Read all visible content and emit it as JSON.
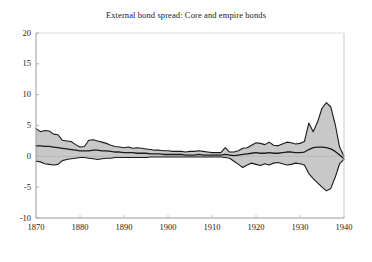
{
  "chart_data": {
    "type": "area",
    "title": "External bond spread: Core and empire bonds",
    "xlabel": "",
    "ylabel": "",
    "xlim": [
      1870,
      1940
    ],
    "ylim": [
      -10,
      20
    ],
    "grid": false,
    "legend": null,
    "xticks": [
      1870,
      1880,
      1890,
      1900,
      1910,
      1920,
      1930,
      1940
    ],
    "yticks": [
      20,
      15,
      10,
      5,
      0,
      -5,
      -10
    ],
    "fill_color": "#c8c8c8",
    "line_color": "#1a1a1a",
    "x": [
      1870,
      1871,
      1872,
      1873,
      1874,
      1875,
      1876,
      1877,
      1878,
      1879,
      1880,
      1881,
      1882,
      1883,
      1884,
      1885,
      1886,
      1887,
      1888,
      1889,
      1890,
      1891,
      1892,
      1893,
      1894,
      1895,
      1896,
      1897,
      1898,
      1899,
      1900,
      1901,
      1902,
      1903,
      1904,
      1905,
      1906,
      1907,
      1908,
      1909,
      1910,
      1911,
      1912,
      1913,
      1914,
      1915,
      1916,
      1917,
      1918,
      1919,
      1920,
      1921,
      1922,
      1923,
      1924,
      1925,
      1926,
      1927,
      1928,
      1929,
      1930,
      1931,
      1932,
      1933,
      1934,
      1935,
      1936,
      1937,
      1938,
      1939,
      1940
    ],
    "series": [
      {
        "name": "upper",
        "values": [
          4.5,
          4.0,
          4.2,
          4.1,
          3.6,
          3.5,
          2.6,
          2.5,
          2.4,
          1.9,
          1.5,
          1.6,
          2.6,
          2.7,
          2.5,
          2.3,
          2.1,
          1.8,
          1.6,
          1.5,
          1.4,
          1.5,
          1.3,
          1.4,
          1.3,
          1.2,
          1.1,
          1.0,
          1.0,
          0.9,
          0.9,
          0.8,
          0.8,
          0.8,
          0.7,
          0.8,
          0.8,
          0.9,
          0.8,
          0.7,
          0.6,
          0.6,
          0.6,
          1.4,
          0.7,
          0.7,
          0.9,
          1.3,
          1.4,
          1.8,
          2.2,
          2.1,
          1.9,
          2.3,
          1.8,
          1.7,
          2.0,
          2.3,
          2.2,
          2.0,
          2.1,
          2.4,
          5.4,
          4.0,
          5.6,
          7.8,
          8.7,
          8.0,
          5.2,
          1.5,
          0.0
        ]
      },
      {
        "name": "middle",
        "values": [
          1.7,
          1.7,
          1.6,
          1.6,
          1.5,
          1.4,
          1.3,
          1.2,
          1.1,
          1.0,
          0.9,
          0.9,
          0.9,
          1.0,
          1.0,
          0.9,
          0.9,
          0.8,
          0.7,
          0.7,
          0.6,
          0.6,
          0.6,
          0.5,
          0.5,
          0.5,
          0.4,
          0.4,
          0.4,
          0.3,
          0.3,
          0.3,
          0.3,
          0.3,
          0.2,
          0.2,
          0.2,
          0.3,
          0.2,
          0.2,
          0.2,
          0.2,
          0.2,
          0.3,
          0.2,
          0.1,
          0.2,
          0.3,
          0.4,
          0.5,
          0.6,
          0.5,
          0.5,
          0.6,
          0.5,
          0.5,
          0.6,
          0.7,
          0.7,
          0.6,
          0.6,
          0.7,
          1.1,
          1.4,
          1.5,
          1.5,
          1.4,
          1.2,
          0.8,
          0.2,
          -0.4
        ]
      },
      {
        "name": "lower",
        "values": [
          -0.8,
          -0.9,
          -1.2,
          -1.3,
          -1.4,
          -1.3,
          -0.7,
          -0.5,
          -0.4,
          -0.3,
          -0.2,
          -0.2,
          -0.3,
          -0.4,
          -0.5,
          -0.4,
          -0.3,
          -0.3,
          -0.2,
          -0.2,
          -0.2,
          -0.2,
          -0.2,
          -0.2,
          -0.2,
          -0.2,
          -0.1,
          -0.1,
          -0.1,
          -0.1,
          -0.1,
          -0.1,
          -0.1,
          -0.1,
          -0.1,
          -0.1,
          -0.1,
          -0.1,
          -0.1,
          -0.1,
          -0.1,
          -0.1,
          -0.1,
          -0.2,
          -0.3,
          -0.8,
          -1.3,
          -1.8,
          -1.4,
          -1.1,
          -1.3,
          -1.5,
          -1.2,
          -1.4,
          -1.1,
          -1.0,
          -1.2,
          -1.4,
          -1.3,
          -1.1,
          -1.2,
          -1.4,
          -2.8,
          -3.6,
          -4.3,
          -5.0,
          -5.6,
          -5.2,
          -3.4,
          -1.2,
          -0.5
        ]
      }
    ]
  }
}
